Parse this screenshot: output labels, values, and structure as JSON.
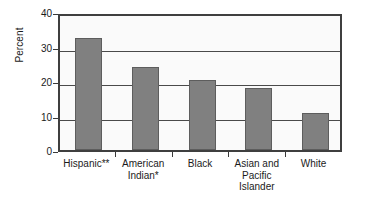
{
  "chart_data": {
    "type": "bar",
    "title": "",
    "subtitle": "",
    "xlabel": "",
    "ylabel": "Percent",
    "categories": [
      "Hispanic**",
      "American\nIndian*",
      "Black",
      "Asian and\nPacific\nIslander",
      "White"
    ],
    "values": [
      32.5,
      24.0,
      20.4,
      18.0,
      10.7
    ],
    "ylim": [
      0,
      40
    ],
    "yticks": [
      0,
      10,
      20,
      30,
      40
    ],
    "ytick_labels": [
      "0",
      "10",
      "20",
      "30",
      "40"
    ],
    "grid": true,
    "grid_axis": "y",
    "legend": false,
    "legend_position": "none",
    "orientation": "vertical",
    "bar_color": "#808080",
    "bar_edge_color": "#5d5d5d",
    "plot_background": "#fafafa",
    "axis_color": "#3f3f3f",
    "gridline_color": "#4a4a4a",
    "page_background": "#ffffff",
    "annotations": []
  },
  "axis": {
    "y_title": "Percent"
  }
}
